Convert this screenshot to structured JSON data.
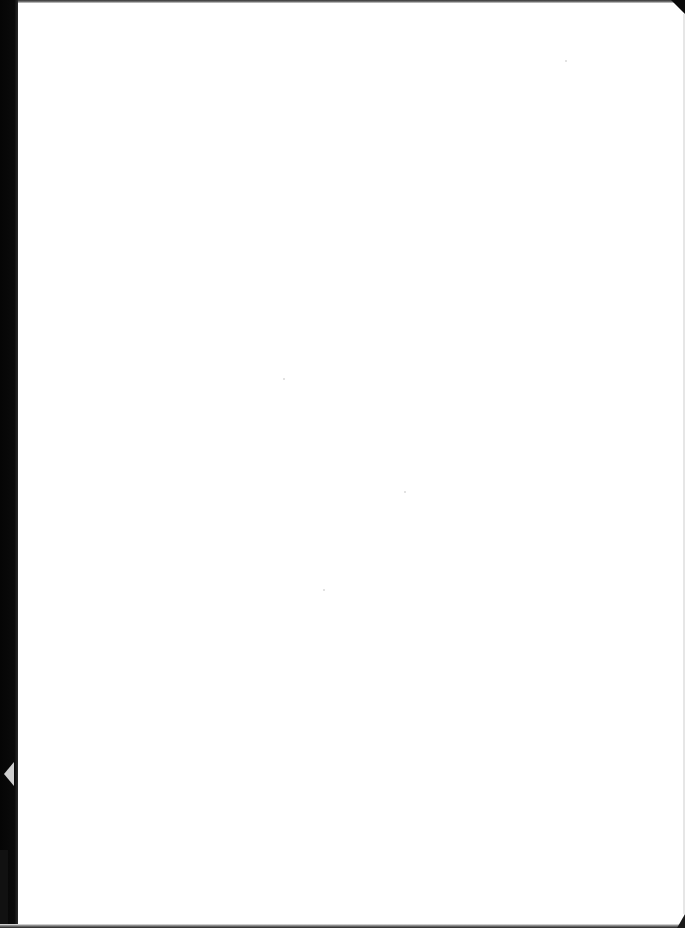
{
  "page": {
    "type": "blank scanned page",
    "background_color": "#ffffff",
    "border_color": "#0a0a0a",
    "text_content": ""
  },
  "specks": [
    {
      "x": 283,
      "y": 378
    },
    {
      "x": 404,
      "y": 491
    },
    {
      "x": 323,
      "y": 589
    },
    {
      "x": 565,
      "y": 60
    }
  ]
}
